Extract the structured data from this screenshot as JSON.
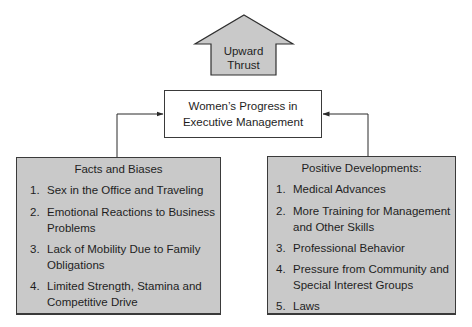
{
  "diagram": {
    "arrow": {
      "label_line1": "Upward",
      "label_line2": "Thrust",
      "fill": "#c9c9c9"
    },
    "center": {
      "line1": "Women’s Progress in",
      "line2": "Executive Management"
    },
    "left_box": {
      "title": "Facts and Biases",
      "fill": "#c9c9c9",
      "items": [
        {
          "num": "1.",
          "text": "Sex in the Office and Traveling"
        },
        {
          "num": "2.",
          "text": "Emotional Reactions to Business\nProblems"
        },
        {
          "num": "3.",
          "text": "Lack of Mobility Due to Family\nObligations"
        },
        {
          "num": "4.",
          "text": "Limited Strength, Stamina and\nCompetitive Drive"
        }
      ]
    },
    "right_box": {
      "title": "Positive Developments:",
      "fill": "#c9c9c9",
      "items": [
        {
          "num": "1.",
          "text": "Medical Advances"
        },
        {
          "num": "2.",
          "text": "More Training for Management\nand Other Skills"
        },
        {
          "num": "3.",
          "text": "Professional Behavior"
        },
        {
          "num": "4.",
          "text": "Pressure from Community and\nSpecial Interest Groups"
        },
        {
          "num": "5.",
          "text": "Laws"
        }
      ]
    }
  }
}
